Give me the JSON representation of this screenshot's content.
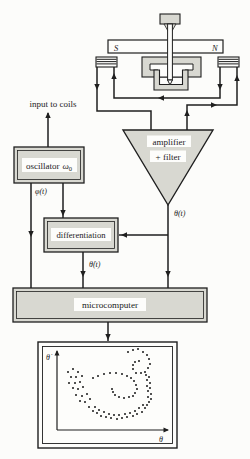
{
  "colors": {
    "ink": "#1f1f1f",
    "box_fill": "#d8d8d1",
    "label_bg": "#fdfdfb",
    "background": "#fcfcfa"
  },
  "apparatus": {
    "magnet_pole_left": "S",
    "magnet_pole_right": "N"
  },
  "labels": {
    "input_to_coils": "input to coils",
    "oscillator_word": "oscillator",
    "omega": "ω",
    "omega_sub": "0",
    "phi_signal": "φ(t)",
    "amplifier_line1": "amplifier",
    "amplifier_line2": "+ filter",
    "theta_signal": "θ(t)",
    "differentiation": "differentiation",
    "theta_dot_signal": "θ̇(t)",
    "microcomputer": "microcomputer"
  },
  "phase_plot": {
    "type": "scatter",
    "xlabel": "θ",
    "ylabel": "θ̇",
    "axes_numeric_ticks": "none",
    "point_size_px": 1.8,
    "points_units": "pixels relative to display box top-left",
    "points": [
      [
        90,
        10
      ],
      [
        95,
        8
      ],
      [
        100,
        7
      ],
      [
        105,
        10
      ],
      [
        109,
        13
      ],
      [
        111,
        17
      ],
      [
        112,
        22
      ],
      [
        110,
        26
      ],
      [
        107,
        30
      ],
      [
        103,
        31
      ],
      [
        98,
        31
      ],
      [
        95,
        27
      ],
      [
        95,
        23
      ],
      [
        97,
        20
      ],
      [
        101,
        19
      ],
      [
        108,
        33
      ],
      [
        111,
        35
      ],
      [
        109,
        38
      ],
      [
        112,
        41
      ],
      [
        109,
        44
      ],
      [
        112,
        46
      ],
      [
        110,
        49
      ],
      [
        113,
        52
      ],
      [
        110,
        55
      ],
      [
        113,
        57
      ],
      [
        111,
        60
      ],
      [
        109,
        63
      ],
      [
        107,
        66
      ],
      [
        104,
        70
      ],
      [
        99,
        72
      ],
      [
        95,
        74
      ],
      [
        89,
        75
      ],
      [
        84,
        76
      ],
      [
        79,
        77
      ],
      [
        73,
        76
      ],
      [
        68,
        75
      ],
      [
        63,
        74
      ],
      [
        59,
        71
      ],
      [
        55,
        69
      ],
      [
        51,
        65
      ],
      [
        105,
        63
      ],
      [
        101,
        66
      ],
      [
        97,
        69
      ],
      [
        92,
        71
      ],
      [
        87,
        72
      ],
      [
        81,
        73
      ],
      [
        76,
        73
      ],
      [
        71,
        72
      ],
      [
        66,
        70
      ],
      [
        61,
        68
      ],
      [
        57,
        65
      ],
      [
        30,
        30
      ],
      [
        35,
        27
      ],
      [
        40,
        30
      ],
      [
        33,
        35
      ],
      [
        38,
        35
      ],
      [
        44,
        34
      ],
      [
        31,
        41
      ],
      [
        37,
        41
      ],
      [
        42,
        40
      ],
      [
        35,
        46
      ],
      [
        40,
        47
      ],
      [
        45,
        45
      ],
      [
        38,
        53
      ],
      [
        44,
        54
      ],
      [
        49,
        52
      ],
      [
        42,
        59
      ],
      [
        47,
        60
      ],
      [
        52,
        57
      ],
      [
        55,
        36
      ],
      [
        60,
        34
      ],
      [
        66,
        32
      ],
      [
        72,
        31
      ],
      [
        78,
        31
      ],
      [
        84,
        32
      ],
      [
        89,
        34
      ],
      [
        93,
        36
      ],
      [
        96,
        39
      ],
      [
        98,
        43
      ],
      [
        99,
        47
      ],
      [
        97,
        51
      ],
      [
        95,
        54
      ],
      [
        91,
        55
      ],
      [
        86,
        56
      ],
      [
        81,
        55
      ],
      [
        77,
        53
      ],
      [
        75,
        50
      ],
      [
        74,
        47
      ]
    ]
  }
}
